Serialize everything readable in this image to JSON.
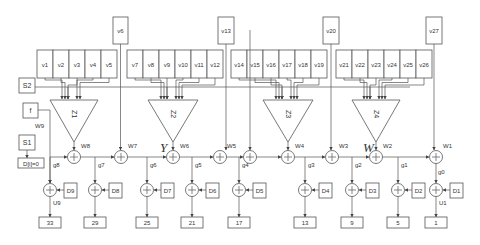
{
  "diagram": {
    "top_inputs": [
      {
        "label": "v6",
        "x": 113,
        "w": 15
      },
      {
        "label": "v13",
        "x": 218,
        "w": 16
      },
      {
        "label": "v20",
        "x": 323,
        "w": 16
      },
      {
        "label": "v27",
        "x": 426,
        "w": 16
      }
    ],
    "groups": [
      {
        "x": 37,
        "cells": [
          "v1",
          "v2",
          "v3",
          "v4",
          "v5"
        ],
        "triangle": {
          "label": "Z1",
          "left": 50,
          "right": 98,
          "apex_x": 74
        }
      },
      {
        "x": 127,
        "cells": [
          "v7",
          "v8",
          "v9",
          "v10",
          "v11",
          "v12"
        ],
        "triangle": {
          "label": "Z2",
          "left": 148,
          "right": 198,
          "apex_x": 173
        }
      },
      {
        "x": 231,
        "cells": [
          "v14",
          "v15",
          "v16",
          "v17",
          "v18",
          "v19"
        ],
        "triangle": {
          "label": "Z3",
          "left": 263,
          "right": 313,
          "apex_x": 288
        }
      },
      {
        "x": 336,
        "cells": [
          "v21",
          "v22",
          "v23",
          "v24",
          "v25",
          "v26"
        ],
        "triangle": {
          "label": "Z4",
          "left": 352,
          "right": 400,
          "apex_x": 376
        }
      }
    ],
    "side_boxes": {
      "s2": "S2",
      "f": "f",
      "s1": "S1",
      "d_init": "D[i]=0"
    },
    "labels": {
      "w9": "W9",
      "y": "Y",
      "w": "W",
      "u9": "U9",
      "u1": "U1",
      "g0": "g0"
    },
    "main_adders": [
      {
        "x": 74,
        "w": "W8"
      },
      {
        "x": 121,
        "w": "W7"
      },
      {
        "x": 173,
        "w": "W6"
      },
      {
        "x": 220,
        "w": "W5"
      },
      {
        "x": 250,
        "w": ""
      },
      {
        "x": 288,
        "w": "W4"
      },
      {
        "x": 332,
        "w": "W3"
      },
      {
        "x": 376,
        "w": "W2"
      },
      {
        "x": 436,
        "w": "W1"
      }
    ],
    "taps": [
      {
        "g": "g8",
        "x": 50,
        "d": "D9",
        "out": "33"
      },
      {
        "g": "g7",
        "x": 95,
        "d": "D8",
        "out": "29"
      },
      {
        "g": "g6",
        "x": 147,
        "d": "D7",
        "out": "25"
      },
      {
        "g": "g5",
        "x": 192,
        "d": "D6",
        "out": "21"
      },
      {
        "g": "g4",
        "x": 239,
        "d": "D5",
        "out": "17"
      },
      {
        "g": "g3",
        "x": 305,
        "d": "D4",
        "out": "13"
      },
      {
        "g": "g2",
        "x": 352,
        "d": "D3",
        "out": "9"
      },
      {
        "g": "g1",
        "x": 398,
        "d": "D2",
        "out": "5"
      },
      {
        "g": "",
        "x": 436,
        "d": "D1",
        "out": "1"
      }
    ]
  }
}
